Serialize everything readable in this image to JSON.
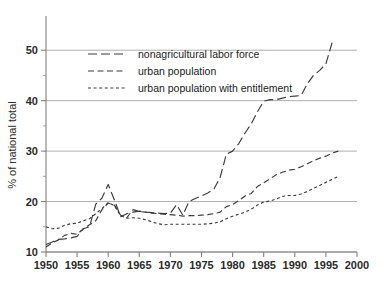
{
  "chart_data": {
    "type": "line",
    "title": "",
    "xlabel": "",
    "ylabel": "% of national total",
    "xlim": [
      1950,
      2000
    ],
    "ylim": [
      10,
      55
    ],
    "grid": true,
    "legend_position": "upper-left-inside",
    "x_ticks": [
      1950,
      1955,
      1960,
      1965,
      1970,
      1975,
      1980,
      1985,
      1990,
      1995,
      2000
    ],
    "y_ticks": [
      10,
      20,
      30,
      40,
      50
    ],
    "y_minor_ticks": [
      15,
      25,
      35,
      45
    ],
    "series": [
      {
        "name": "nonagricultural labor force",
        "dash": "long-dash",
        "x": [
          1950,
          1951,
          1952,
          1953,
          1954,
          1955,
          1956,
          1957,
          1958,
          1959,
          1960,
          1961,
          1962,
          1963,
          1964,
          1965,
          1966,
          1967,
          1968,
          1969,
          1970,
          1971,
          1972,
          1973,
          1974,
          1975,
          1976,
          1977,
          1978,
          1979,
          1980,
          1981,
          1982,
          1983,
          1984,
          1985,
          1986,
          1987,
          1988,
          1989,
          1990,
          1991,
          1992,
          1993,
          1994,
          1995,
          1996
        ],
        "values": [
          11.5,
          12.0,
          12.5,
          12.6,
          12.8,
          13.1,
          14.6,
          15.0,
          19.5,
          20.7,
          23.4,
          20.3,
          17.0,
          17.6,
          17.9,
          18.1,
          17.9,
          17.8,
          17.7,
          17.6,
          17.7,
          19.4,
          17.3,
          20.0,
          20.6,
          21.1,
          21.7,
          22.5,
          24.8,
          29.4,
          30.0,
          31.5,
          33.6,
          35.4,
          37.8,
          39.9,
          40.2,
          40.2,
          40.5,
          40.8,
          40.9,
          41.0,
          43.3,
          45.0,
          46.0,
          47.3,
          51.5
        ]
      },
      {
        "name": "urban population",
        "dash": "medium-dash",
        "x": [
          1950,
          1951,
          1952,
          1953,
          1954,
          1955,
          1956,
          1957,
          1958,
          1959,
          1960,
          1961,
          1962,
          1963,
          1964,
          1965,
          1966,
          1967,
          1968,
          1969,
          1970,
          1971,
          1972,
          1973,
          1974,
          1975,
          1976,
          1977,
          1978,
          1979,
          1980,
          1981,
          1982,
          1983,
          1984,
          1985,
          1986,
          1987,
          1988,
          1989,
          1990,
          1991,
          1992,
          1993,
          1994,
          1995,
          1996,
          1997
        ],
        "values": [
          11.0,
          11.8,
          12.4,
          13.3,
          13.7,
          13.5,
          14.6,
          15.4,
          16.2,
          18.4,
          19.7,
          19.3,
          17.3,
          16.8,
          18.4,
          18.0,
          17.9,
          17.7,
          17.6,
          17.5,
          17.4,
          17.3,
          17.1,
          17.2,
          17.2,
          17.3,
          17.4,
          17.6,
          17.9,
          19.0,
          19.4,
          20.2,
          21.1,
          21.6,
          23.0,
          23.7,
          24.5,
          25.3,
          25.8,
          26.2,
          26.4,
          26.9,
          27.5,
          28.1,
          28.6,
          29.0,
          29.6,
          30.0
        ]
      },
      {
        "name": "urban population with entitlement",
        "dash": "short-dash",
        "x": [
          1950,
          1951,
          1952,
          1953,
          1954,
          1955,
          1956,
          1957,
          1958,
          1959,
          1960,
          1961,
          1962,
          1963,
          1964,
          1965,
          1966,
          1967,
          1968,
          1969,
          1970,
          1971,
          1972,
          1973,
          1974,
          1975,
          1976,
          1977,
          1978,
          1979,
          1980,
          1981,
          1982,
          1983,
          1984,
          1985,
          1986,
          1987,
          1988,
          1989,
          1990,
          1991,
          1992,
          1993,
          1994,
          1995,
          1996,
          1997
        ],
        "values": [
          15.0,
          14.6,
          14.7,
          15.3,
          15.6,
          15.7,
          16.2,
          16.6,
          17.6,
          18.6,
          19.8,
          19.2,
          17.2,
          16.7,
          16.8,
          16.7,
          16.4,
          16.0,
          15.6,
          15.4,
          15.5,
          15.5,
          15.5,
          15.5,
          15.5,
          15.5,
          15.6,
          15.7,
          16.0,
          16.6,
          17.1,
          17.5,
          17.9,
          18.5,
          19.3,
          19.9,
          20.1,
          20.5,
          21.0,
          21.2,
          21.2,
          21.5,
          22.0,
          22.6,
          23.2,
          23.8,
          24.4,
          25.0
        ]
      }
    ],
    "legend": [
      {
        "label": "nonagricultural labor force"
      },
      {
        "label": "urban population"
      },
      {
        "label": "urban population with entitlement"
      }
    ]
  },
  "colors": {
    "line": "#3b3b3b",
    "axis": "#808080",
    "grid": "#9a9a9a",
    "text": "#2b2b2b",
    "background": "#ffffff"
  }
}
